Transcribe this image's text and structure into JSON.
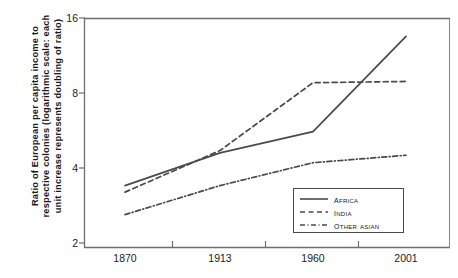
{
  "chart_data": {
    "type": "line",
    "title": "",
    "xlabel": "",
    "ylabel": "Ratio of European per capita income to respective colonies (logarithmic scale: each unit increase represents doubling of ratio)",
    "ylabel_lines": [
      "Ratio of European per capita income to",
      "respective colonies (logarithmic scale: each",
      "unit increase represents doubling of ratio)"
    ],
    "scale": "log2",
    "categories": [
      "1870",
      "1913",
      "1960",
      "2001"
    ],
    "x": [
      1870,
      1913,
      1960,
      2001
    ],
    "xlim": [
      1870,
      2001
    ],
    "ylim": [
      2,
      16
    ],
    "yticks": [
      2,
      4,
      8,
      16
    ],
    "ytick_labels": [
      "2",
      "4",
      "8",
      "16"
    ],
    "xtick_labels": [
      "1870",
      "1913",
      "1960",
      "2001"
    ],
    "grid": false,
    "legend_position": "bottom-right",
    "series": [
      {
        "name": "Africa",
        "label": "Africa",
        "style": "solid",
        "color": "#4a4a4a",
        "values": [
          3.4,
          4.6,
          5.6,
          13.5
        ]
      },
      {
        "name": "India",
        "label": "India",
        "style": "dashed",
        "color": "#4a4a4a",
        "values": [
          3.2,
          4.7,
          8.8,
          8.9
        ]
      },
      {
        "name": "Other Asian",
        "label": "Other Asian",
        "style": "dash-dot",
        "color": "#4a4a4a",
        "values": [
          2.6,
          3.4,
          4.2,
          4.5
        ]
      }
    ]
  },
  "axis": {
    "line_color": "#6e6e6e"
  }
}
